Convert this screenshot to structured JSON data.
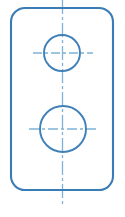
{
  "drawing": {
    "title": "Rectangular plate with two holes",
    "type": "engineering-drawing-orthographic-view",
    "canvas": {
      "width": 125,
      "height": 217,
      "background_color": "#ffffff"
    },
    "colors": {
      "outline_stroke": "#3a7cb5",
      "circle_stroke": "#3f80b8",
      "centerline_stroke": "#7fb2d6",
      "fill": "none"
    },
    "stroke_widths": {
      "outline": 2.1,
      "circle": 1.9,
      "centerline": 1.3
    },
    "plate": {
      "name": "rounded-rectangle-outline",
      "x": 11,
      "y": 8,
      "width": 102,
      "height": 182,
      "corner_radius": 14
    },
    "holes": [
      {
        "name": "upper-hole",
        "label": "small hole",
        "cx": 62,
        "cy": 53,
        "r": 18
      },
      {
        "name": "lower-hole",
        "label": "large hole",
        "cx": 63,
        "cy": 129,
        "r": 23
      }
    ],
    "centerlines": {
      "vertical": {
        "name": "vertical-centerline",
        "x": 62.5,
        "y1": 0,
        "y2": 206,
        "dash_pattern": "14 3 3 3"
      },
      "horizontal": [
        {
          "name": "upper-hole-horizontal-centerline",
          "y": 53,
          "x1": 33,
          "x2": 93,
          "dash_pattern": "9 3 3 3"
        },
        {
          "name": "lower-hole-horizontal-centerline",
          "y": 129,
          "x1": 29,
          "x2": 98,
          "dash_pattern": "10 3 3 3"
        }
      ]
    }
  }
}
